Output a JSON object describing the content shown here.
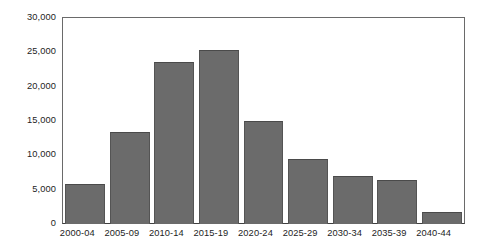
{
  "chart_data": {
    "type": "bar",
    "title": "",
    "subtitle": "",
    "xlabel": "",
    "ylabel": "",
    "categories": [
      "2000-04",
      "2005-09",
      "2010-14",
      "2015-19",
      "2020-24",
      "2025-29",
      "2030-34",
      "2035-39",
      "2040-44"
    ],
    "values": [
      5900,
      13400,
      23600,
      25400,
      15000,
      9400,
      7000,
      6400,
      1800
    ],
    "ylim": [
      0,
      30000
    ],
    "ytick_values": [
      0,
      5000,
      10000,
      15000,
      20000,
      25000,
      30000
    ],
    "ytick_labels": [
      "0",
      "5,000",
      "10,000",
      "15,000",
      "20,000",
      "25,000",
      "30,000"
    ],
    "grid": false,
    "legend": false,
    "legend_position": "none",
    "bar_color": "#6b6b6b",
    "bar_edge_color": "#4a4a4a",
    "frame_color": "#6a6a6a",
    "axis_color": "#3f3f3f",
    "background_color": "#ffffff",
    "text_color": "#1d1d1d"
  }
}
